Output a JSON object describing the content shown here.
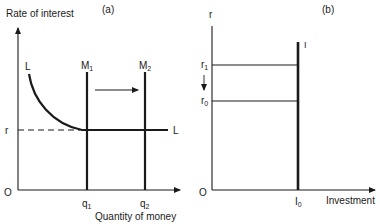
{
  "panel_a": {
    "label": "(a)",
    "y_axis_label": "Rate of interest",
    "x_axis_label": "Quantity of money",
    "origin": "O",
    "curve_L_label": "L",
    "curve_L_end_label": "L",
    "m1": {
      "main": "M",
      "sub": "1"
    },
    "m2": {
      "main": "M",
      "sub": "2"
    },
    "r_label": "r",
    "q1": {
      "main": "q",
      "sub": "1"
    },
    "q2": {
      "main": "q",
      "sub": "2"
    }
  },
  "panel_b": {
    "label": "(b)",
    "y_axis_label": "r",
    "x_axis_label": "Investment",
    "origin": "O",
    "curve_I_label": "I",
    "r1": {
      "main": "r",
      "sub": "1"
    },
    "r0": {
      "main": "r",
      "sub": "0"
    },
    "i0": {
      "main": "I",
      "sub": "0"
    }
  },
  "colors": {
    "ink": "#1a1a1a",
    "background": "#ffffff"
  }
}
